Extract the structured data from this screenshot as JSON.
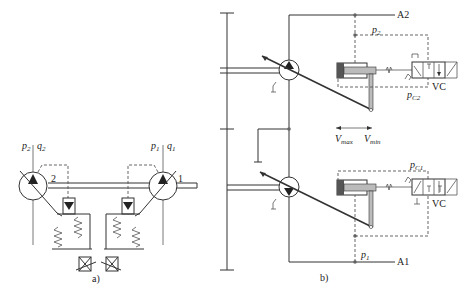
{
  "figure_a": {
    "caption": "a)",
    "pump_left": {
      "number": "2",
      "pressure_label": "p",
      "pressure_sub": "2",
      "flow_label": "q",
      "flow_sub": "2"
    },
    "pump_right": {
      "number": "1",
      "pressure_label": "p",
      "pressure_sub": "1",
      "flow_label": "q",
      "flow_sub": "1"
    }
  },
  "figure_b": {
    "caption": "b)",
    "line_top": "A2",
    "line_bottom": "A1",
    "upper": {
      "pressure_label": "p",
      "pressure_sub": "2",
      "control_label": "p",
      "control_sub": "C2",
      "valve_label": "VC"
    },
    "lower": {
      "pressure_label": "p",
      "pressure_sub": "1",
      "control_label": "p",
      "control_sub": "C1",
      "valve_label": "VC"
    },
    "arrow": {
      "left_label": "V",
      "left_sub": "max",
      "right_label": "V",
      "right_sub": "min"
    }
  },
  "colors": {
    "line": "#333333",
    "cylinder_dark": "#555555",
    "piston": "#bbbbbb"
  }
}
